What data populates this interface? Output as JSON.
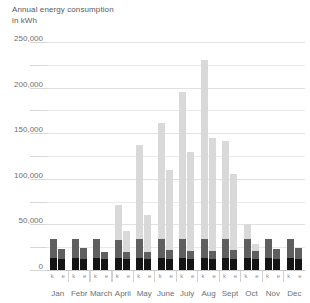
{
  "title": {
    "line1": "Annual energy consumption",
    "line2": "in kWh"
  },
  "chart_data": {
    "type": "bar",
    "title": "Annual energy consumption in kWh",
    "subtitle": "in kWh",
    "xlabel": "",
    "ylabel": "kWh",
    "ylim": [
      0,
      250000
    ],
    "grid": true,
    "legend_position": "none",
    "stacked": true,
    "categories": [
      "Jan",
      "Febr",
      "March",
      "April",
      "May",
      "June",
      "July",
      "Aug",
      "Sept",
      "Oct",
      "Nov",
      "Dec"
    ],
    "subcategories": [
      "k",
      "e"
    ],
    "ytick_labels": [
      "0",
      "50,000",
      "100,000",
      "150,000",
      "200,000",
      "250,000"
    ],
    "ytick_values": [
      0,
      50000,
      100000,
      150000,
      200000,
      250000
    ],
    "minor_tick_values": [
      25000,
      75000,
      125000,
      175000,
      225000
    ],
    "series": [
      {
        "name": "dark",
        "color": "#141414"
      },
      {
        "name": "mid",
        "color": "#5f5f5f"
      },
      {
        "name": "light",
        "color": "#d9d9d9"
      }
    ],
    "bars": [
      {
        "month": "Jan",
        "sub": "k",
        "dark": 13000,
        "mid": 21000,
        "light": 0
      },
      {
        "month": "Jan",
        "sub": "e",
        "dark": 12000,
        "mid": 11000,
        "light": 0
      },
      {
        "month": "Febr",
        "sub": "k",
        "dark": 13000,
        "mid": 21000,
        "light": 0
      },
      {
        "month": "Febr",
        "sub": "e",
        "dark": 12000,
        "mid": 12000,
        "light": 0
      },
      {
        "month": "March",
        "sub": "k",
        "dark": 13000,
        "mid": 21000,
        "light": 0
      },
      {
        "month": "March",
        "sub": "e",
        "dark": 12000,
        "mid": 8000,
        "light": 0
      },
      {
        "month": "April",
        "sub": "k",
        "dark": 13000,
        "mid": 20000,
        "light": 38000
      },
      {
        "month": "April",
        "sub": "e",
        "dark": 12000,
        "mid": 8000,
        "light": 23000
      },
      {
        "month": "May",
        "sub": "k",
        "dark": 13000,
        "mid": 21000,
        "light": 103000
      },
      {
        "month": "May",
        "sub": "e",
        "dark": 12000,
        "mid": 8000,
        "light": 40000
      },
      {
        "month": "June",
        "sub": "k",
        "dark": 13000,
        "mid": 21000,
        "light": 127000
      },
      {
        "month": "June",
        "sub": "e",
        "dark": 12000,
        "mid": 10000,
        "light": 88000
      },
      {
        "month": "July",
        "sub": "k",
        "dark": 13000,
        "mid": 21000,
        "light": 161000
      },
      {
        "month": "July",
        "sub": "e",
        "dark": 12000,
        "mid": 9000,
        "light": 108000
      },
      {
        "month": "Aug",
        "sub": "k",
        "dark": 13000,
        "mid": 21000,
        "light": 196000
      },
      {
        "month": "Aug",
        "sub": "e",
        "dark": 12000,
        "mid": 9000,
        "light": 124000
      },
      {
        "month": "Sept",
        "sub": "k",
        "dark": 13000,
        "mid": 21000,
        "light": 107000
      },
      {
        "month": "Sept",
        "sub": "e",
        "dark": 12000,
        "mid": 10000,
        "light": 83000
      },
      {
        "month": "Oct",
        "sub": "k",
        "dark": 13000,
        "mid": 21000,
        "light": 16000
      },
      {
        "month": "Oct",
        "sub": "e",
        "dark": 12000,
        "mid": 9000,
        "light": 7000
      },
      {
        "month": "Nov",
        "sub": "k",
        "dark": 13000,
        "mid": 21000,
        "light": 0
      },
      {
        "month": "Nov",
        "sub": "e",
        "dark": 12000,
        "mid": 11000,
        "light": 0
      },
      {
        "month": "Dec",
        "sub": "k",
        "dark": 13000,
        "mid": 21000,
        "light": 0
      },
      {
        "month": "Dec",
        "sub": "e",
        "dark": 12000,
        "mid": 12000,
        "light": 0
      }
    ]
  },
  "colors": {
    "background": "#ffffff",
    "text": "#6f6f6f",
    "grid": "#e9e9e9",
    "axis": "#c9c9c9"
  }
}
